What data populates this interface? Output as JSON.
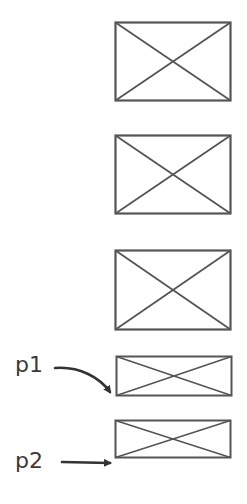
{
  "diagram": {
    "type": "wireframe-placeholders",
    "stroke_color": "#555555",
    "background": "#ffffff",
    "boxes": [
      {
        "id": "box-1",
        "x": 115,
        "y": 22,
        "w": 116,
        "h": 79,
        "kind": "image-placeholder"
      },
      {
        "id": "box-2",
        "x": 115,
        "y": 135,
        "w": 116,
        "h": 79,
        "kind": "image-placeholder"
      },
      {
        "id": "box-3",
        "x": 115,
        "y": 250,
        "w": 116,
        "h": 79,
        "kind": "image-placeholder"
      },
      {
        "id": "box-4",
        "x": 116,
        "y": 356,
        "w": 116,
        "h": 40,
        "kind": "image-placeholder"
      },
      {
        "id": "box-5",
        "x": 115,
        "y": 420,
        "w": 116,
        "h": 38,
        "kind": "image-placeholder"
      }
    ],
    "labels": [
      {
        "id": "p1",
        "text": "p1",
        "points_to": "box-4"
      },
      {
        "id": "p2",
        "text": "p2",
        "points_to": "box-5"
      }
    ]
  }
}
